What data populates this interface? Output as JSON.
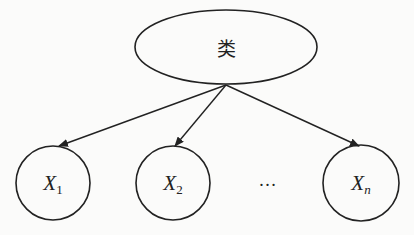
{
  "diagram": {
    "type": "naive-bayes-graph",
    "root": {
      "label": "类",
      "shape": "ellipse",
      "cx": 226,
      "cy": 47,
      "rx": 91,
      "ry": 37
    },
    "children": [
      {
        "name": "X",
        "subscript": "1",
        "sub_italic": false,
        "cx": 53,
        "cy": 183,
        "r": 37
      },
      {
        "name": "X",
        "subscript": "2",
        "sub_italic": false,
        "cx": 173,
        "cy": 183,
        "r": 37
      },
      {
        "name": "X",
        "subscript": "n",
        "sub_italic": true,
        "cx": 361,
        "cy": 183,
        "r": 38
      }
    ],
    "ellipsis": {
      "label": "…",
      "x": 268,
      "y": 182
    },
    "edges": [
      {
        "from": "root",
        "to": "X1"
      },
      {
        "from": "root",
        "to": "X2"
      },
      {
        "from": "root",
        "to": "Xn"
      }
    ],
    "colors": {
      "stroke": "#222222",
      "background": "#fbfbfa"
    }
  }
}
